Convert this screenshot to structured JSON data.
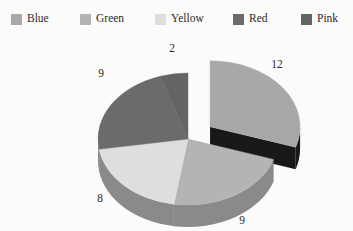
{
  "legend": {
    "position": "top",
    "items": [
      {
        "label": "Blue",
        "color": "#a8a8a8",
        "x": 11
      },
      {
        "label": "Green",
        "color": "#b4b4b4",
        "x": 80
      },
      {
        "label": "Yellow",
        "color": "#dedede",
        "x": 155
      },
      {
        "label": "Red",
        "color": "#6b6b6b",
        "x": 233
      },
      {
        "label": "Pink",
        "color": "#646464",
        "x": 301
      }
    ]
  },
  "chart_data": {
    "type": "pie",
    "title": "",
    "subtitle": "",
    "xlabel": "",
    "ylabel": "",
    "total": 40,
    "three_d": true,
    "exploded_slice": "Blue",
    "grid": false,
    "legend_position": "top",
    "categories": [
      "Blue",
      "Green",
      "Yellow",
      "Red",
      "Pink"
    ],
    "values": [
      12,
      9,
      8,
      9,
      2
    ],
    "labels": [
      "12",
      "9",
      "8",
      "9",
      "2"
    ],
    "colors": [
      "#a8a8a8",
      "#b4b4b4",
      "#dedede",
      "#6b6b6b",
      "#646464"
    ],
    "side_colors": [
      "#181818",
      "#8a8a8a",
      "#8a8a8a",
      "#8a8a8a",
      "#8a8a8a"
    ],
    "slices": [
      {
        "name": "Blue",
        "value": 12,
        "label": "12",
        "color": "#a8a8a8",
        "side_color": "#181818",
        "percent": 30,
        "degrees": 108,
        "exploded": true,
        "label_x": 277,
        "label_y": 29
      },
      {
        "name": "Green",
        "value": 9,
        "label": "9",
        "color": "#b4b4b4",
        "side_color": "#8a8a8a",
        "percent": 22.5,
        "degrees": 81,
        "exploded": false,
        "label_x": 242,
        "label_y": 185
      },
      {
        "name": "Yellow",
        "value": 8,
        "label": "8",
        "color": "#dedede",
        "side_color": "#8a8a8a",
        "percent": 20,
        "degrees": 72,
        "exploded": false,
        "label_x": 100,
        "label_y": 163
      },
      {
        "name": "Red",
        "value": 9,
        "label": "9",
        "color": "#6b6b6b",
        "side_color": "#8a8a8a",
        "percent": 22.5,
        "degrees": 81,
        "exploded": false,
        "label_x": 101,
        "label_y": 38
      },
      {
        "name": "Pink",
        "value": 2,
        "label": "2",
        "color": "#646464",
        "side_color": "#8a8a8a",
        "percent": 5,
        "degrees": 18,
        "exploded": false,
        "label_x": 172,
        "label_y": 13
      }
    ]
  },
  "background_color": "#fbfbf9",
  "text_color": "#2b2b2b"
}
